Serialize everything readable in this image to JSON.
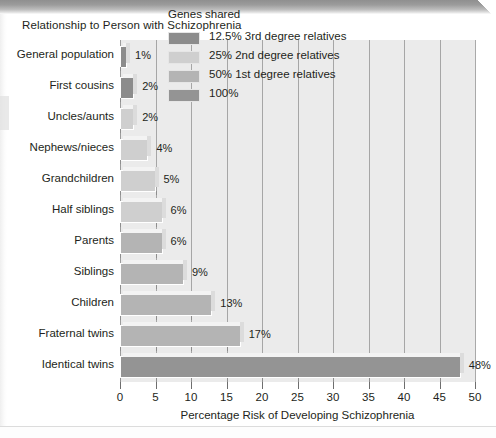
{
  "chart_data": {
    "type": "bar",
    "orientation": "horizontal",
    "title": "Relationship to Person with Schizophrenia",
    "xlabel": "Percentage Risk of Developing Schizophrenia",
    "ylabel": "",
    "xlim": [
      0,
      50
    ],
    "xticks": [
      0,
      5,
      10,
      15,
      20,
      25,
      30,
      35,
      40,
      45,
      50
    ],
    "xtick_labels": [
      "0",
      "5",
      "10",
      "15",
      "20",
      "25",
      "30",
      "35",
      "40",
      "45",
      "50"
    ],
    "grid": true,
    "grid_axis": "x",
    "legend_position": "top-right-inside",
    "categories": [
      "General population",
      "First cousins",
      "Uncles/aunts",
      "Nephews/nieces",
      "Grandchildren",
      "Half siblings",
      "Parents",
      "Siblings",
      "Children",
      "Fraternal twins",
      "Identical twins"
    ],
    "values": [
      1,
      2,
      2,
      4,
      5,
      6,
      6,
      9,
      13,
      17,
      48
    ],
    "value_labels": [
      "1%",
      "2%",
      "2%",
      "4%",
      "5%",
      "6%",
      "6%",
      "9%",
      "13%",
      "17%",
      "48%"
    ],
    "group_of_category": [
      "12.5% 3rd degree relatives",
      "12.5% 3rd degree relatives",
      "25% 2nd degree relatives",
      "25% 2nd degree relatives",
      "25% 2nd degree relatives",
      "25% 2nd degree relatives",
      "50% 1st degree relatives",
      "50% 1st degree relatives",
      "50% 1st degree relatives",
      "50% 1st degree relatives",
      "100%"
    ],
    "bar_colors": [
      "#8c8c8c",
      "#8c8c8c",
      "#cfcfcf",
      "#cfcfcf",
      "#cfcfcf",
      "#cfcfcf",
      "#b4b4b4",
      "#b4b4b4",
      "#b4b4b4",
      "#b4b4b4",
      "#949494"
    ],
    "legend": {
      "title": "Genes shared",
      "entries": [
        {
          "label": "12.5% 3rd degree relatives",
          "color": "#8c8c8c"
        },
        {
          "label": "25% 2nd degree relatives",
          "color": "#cfcfcf"
        },
        {
          "label": "50% 1st degree relatives",
          "color": "#b4b4b4"
        },
        {
          "label": "100%",
          "color": "#949494"
        }
      ]
    },
    "plot_background": "#ebebeb",
    "gridline_color": "#9a9a9a",
    "page_background": "#ffffff"
  }
}
